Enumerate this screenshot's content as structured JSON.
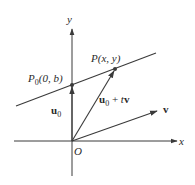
{
  "diagram": {
    "type": "vector-line-parametrization",
    "axes": {
      "x_label": "x",
      "y_label": "y",
      "origin_label": "O"
    },
    "points": {
      "p0": {
        "name": "P",
        "sub": "0",
        "coords": "(0, b)"
      },
      "p": {
        "name": "P",
        "coords": "(x, y)"
      }
    },
    "vectors": {
      "u0": {
        "name": "u",
        "sub": "0"
      },
      "u0_plus_tv": {
        "name": "u",
        "sub": "0",
        "rest_op": " + ",
        "t": "t",
        "v": "v"
      },
      "v": {
        "name": "v"
      }
    },
    "colors": {
      "stroke": "#3a3a3a",
      "text": "#2a2a2a",
      "background": "#ffffff"
    }
  }
}
